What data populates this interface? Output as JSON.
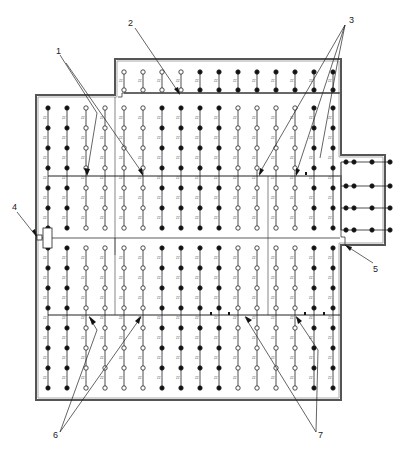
{
  "diagram": {
    "type": "floor-plan-node-layout",
    "colors": {
      "wall": "#555555",
      "wall_inner": "#999999",
      "line": "#222222",
      "node_fill": "#111111",
      "node_open": "#ffffff",
      "label": "#222222"
    },
    "callouts": [
      {
        "id": "1",
        "label": "1",
        "x": 56,
        "y": 52
      },
      {
        "id": "2",
        "label": "2",
        "x": 130,
        "y": 24
      },
      {
        "id": "3",
        "label": "3",
        "x": 349,
        "y": 20
      },
      {
        "id": "4",
        "label": "4",
        "x": 14,
        "y": 208
      },
      {
        "id": "5",
        "label": "5",
        "x": 372,
        "y": 268
      },
      {
        "id": "6",
        "label": "6",
        "x": 56,
        "y": 435
      },
      {
        "id": "7",
        "label": "7",
        "x": 320,
        "y": 435
      }
    ],
    "node_label": "ZZ",
    "main_columns_x": [
      48,
      67,
      86,
      105,
      124,
      143,
      162,
      181,
      200,
      219,
      238,
      257,
      276,
      295,
      314,
      333
    ],
    "upper_rows_y": [
      108,
      128,
      148,
      168,
      188,
      208,
      228
    ],
    "upper_fill": [
      1,
      1,
      0,
      0,
      0,
      0,
      1,
      1,
      1,
      1,
      0,
      0,
      0,
      0,
      1,
      1
    ],
    "lower_rows_y": [
      248,
      268,
      288,
      308,
      328,
      348,
      368,
      388
    ],
    "lower_fill": [
      1,
      1,
      0,
      0,
      0,
      0,
      1,
      1,
      1,
      1,
      0,
      0,
      0,
      0,
      1,
      1
    ],
    "annex_top_columns_x": [
      124,
      143,
      162,
      181,
      200,
      219,
      238,
      257,
      276,
      295,
      314,
      333
    ],
    "annex_top_rows_y": [
      72,
      90
    ],
    "annex_top_fill": [
      0,
      0,
      0,
      0,
      1,
      1,
      1,
      1,
      1,
      1,
      1,
      1
    ],
    "annex_right_rows_y": [
      162,
      186,
      208,
      230
    ],
    "annex_right_x": [
      354,
      372,
      390
    ]
  }
}
